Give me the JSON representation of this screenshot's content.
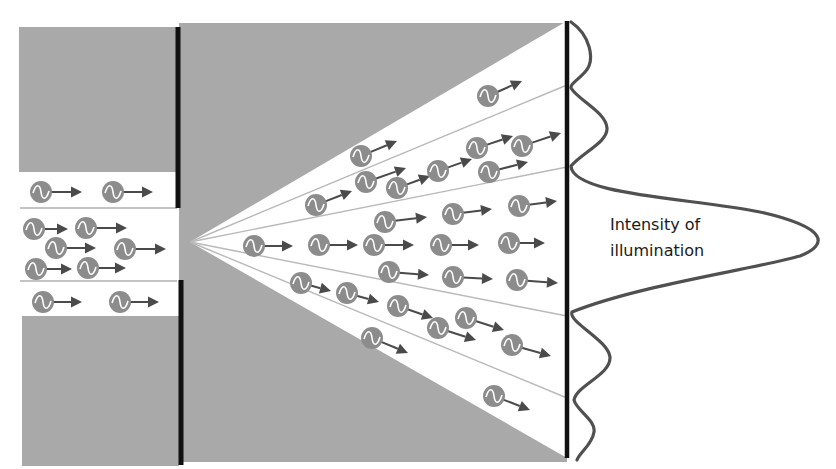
{
  "label": {
    "line1": "Intensity of",
    "line2": "illumination"
  },
  "colors": {
    "shadow": "#a9a9a9",
    "barrier": "#111111",
    "screen": "#111111",
    "fan_line": "#b9b9b9",
    "channel_line": "#b0b0b0",
    "photon_body": "#8c8c8c",
    "photon_wave": "#ffffff",
    "photon_arrow": "#4a4a4a",
    "intensity_curve": "#505050",
    "text": "#1a1a1a"
  },
  "geometry": {
    "apex": [
      190,
      242
    ],
    "screen_x": 567,
    "fan_edges_y": [
      22,
      85,
      167,
      316,
      398,
      457
    ],
    "barrier_x": 179,
    "slit_y": [
      208,
      280
    ]
  },
  "photons_incoming": [
    {
      "x": 41,
      "y": 192,
      "ax": 82,
      "ay": 192
    },
    {
      "x": 113,
      "y": 192,
      "ax": 153,
      "ay": 192
    },
    {
      "x": 34,
      "y": 229,
      "ax": 68,
      "ay": 229
    },
    {
      "x": 86,
      "y": 228,
      "ax": 127,
      "ay": 228
    },
    {
      "x": 56,
      "y": 248,
      "ax": 96,
      "ay": 248
    },
    {
      "x": 125,
      "y": 249,
      "ax": 166,
      "ay": 249
    },
    {
      "x": 36,
      "y": 269,
      "ax": 72,
      "ay": 269
    },
    {
      "x": 88,
      "y": 268,
      "ax": 126,
      "ay": 268
    },
    {
      "x": 43,
      "y": 302,
      "ax": 82,
      "ay": 302
    },
    {
      "x": 120,
      "y": 302,
      "ax": 159,
      "ay": 302
    }
  ],
  "photons_diffracted": [
    {
      "x": 488,
      "y": 96,
      "ax": 522,
      "ay": 81
    },
    {
      "x": 361,
      "y": 156,
      "ax": 397,
      "ay": 141
    },
    {
      "x": 366,
      "y": 182,
      "ax": 406,
      "ay": 168
    },
    {
      "x": 316,
      "y": 205,
      "ax": 352,
      "ay": 191
    },
    {
      "x": 397,
      "y": 188,
      "ax": 430,
      "ay": 176
    },
    {
      "x": 438,
      "y": 171,
      "ax": 472,
      "ay": 159
    },
    {
      "x": 477,
      "y": 148,
      "ax": 513,
      "ay": 136
    },
    {
      "x": 522,
      "y": 146,
      "ax": 561,
      "ay": 133
    },
    {
      "x": 489,
      "y": 172,
      "ax": 528,
      "ay": 162
    },
    {
      "x": 385,
      "y": 222,
      "ax": 427,
      "ay": 217
    },
    {
      "x": 453,
      "y": 214,
      "ax": 492,
      "ay": 209
    },
    {
      "x": 519,
      "y": 206,
      "ax": 557,
      "ay": 201
    },
    {
      "x": 254,
      "y": 246,
      "ax": 293,
      "ay": 246
    },
    {
      "x": 319,
      "y": 245,
      "ax": 358,
      "ay": 245
    },
    {
      "x": 374,
      "y": 245,
      "ax": 414,
      "ay": 245
    },
    {
      "x": 441,
      "y": 245,
      "ax": 479,
      "ay": 245
    },
    {
      "x": 509,
      "y": 243,
      "ax": 545,
      "ay": 243
    },
    {
      "x": 389,
      "y": 272,
      "ax": 429,
      "ay": 275
    },
    {
      "x": 453,
      "y": 277,
      "ax": 493,
      "ay": 279
    },
    {
      "x": 517,
      "y": 280,
      "ax": 558,
      "ay": 283
    },
    {
      "x": 301,
      "y": 283,
      "ax": 331,
      "ay": 291
    },
    {
      "x": 347,
      "y": 293,
      "ax": 379,
      "ay": 302
    },
    {
      "x": 398,
      "y": 306,
      "ax": 433,
      "ay": 318
    },
    {
      "x": 466,
      "y": 318,
      "ax": 504,
      "ay": 330
    },
    {
      "x": 438,
      "y": 328,
      "ax": 476,
      "ay": 340
    },
    {
      "x": 512,
      "y": 345,
      "ax": 551,
      "ay": 356
    },
    {
      "x": 372,
      "y": 338,
      "ax": 408,
      "ay": 353
    },
    {
      "x": 494,
      "y": 396,
      "ax": 530,
      "ay": 410
    }
  ],
  "chart_data": {
    "type": "line",
    "title": "Intensity of illumination",
    "peaks": [
      {
        "position_y": 50,
        "relative_intensity": 0.09
      },
      {
        "position_y": 128,
        "relative_intensity": 0.16
      },
      {
        "position_y": 240,
        "relative_intensity": 1.0
      },
      {
        "position_y": 357,
        "relative_intensity": 0.18
      },
      {
        "position_y": 430,
        "relative_intensity": 0.11
      }
    ],
    "minima_y": [
      85,
      168,
      316,
      398
    ]
  }
}
